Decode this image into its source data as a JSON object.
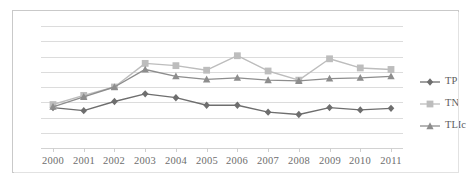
{
  "chart_data": {
    "type": "line",
    "title": "",
    "xlabel": "",
    "ylabel": "",
    "grid": true,
    "legend_position": "right",
    "categories": [
      "2000",
      "2001",
      "2002",
      "2003",
      "2004",
      "2005",
      "2006",
      "2007",
      "2008",
      "2009",
      "2010",
      "2011"
    ],
    "ylim": [
      0,
      8
    ],
    "yticks": [
      0,
      1,
      2,
      3,
      4,
      5,
      6,
      7,
      8
    ],
    "yticklabels_visible": false,
    "series": [
      {
        "name": "TP",
        "marker": "diamond",
        "color": "#6e6e6e",
        "values": [
          2.65,
          2.45,
          3.05,
          3.55,
          3.3,
          2.8,
          2.8,
          2.35,
          2.2,
          2.65,
          2.5,
          2.6
        ]
      },
      {
        "name": "TN",
        "marker": "square",
        "color": "#bdbdbd",
        "values": [
          2.85,
          3.45,
          4.0,
          5.55,
          5.4,
          5.1,
          6.05,
          5.05,
          4.45,
          5.85,
          5.25,
          5.15
        ]
      },
      {
        "name": "TLIc",
        "marker": "triangle",
        "color": "#8d8d8d",
        "values": [
          2.7,
          3.35,
          4.0,
          5.15,
          4.7,
          4.5,
          4.6,
          4.45,
          4.4,
          4.55,
          4.6,
          4.7
        ]
      }
    ]
  },
  "legend": {
    "entries": [
      {
        "label": "TP"
      },
      {
        "label": "TN"
      },
      {
        "label": "TLIc"
      }
    ]
  },
  "axis": {
    "x_tick_labels": [
      "2000",
      "2001",
      "2002",
      "2003",
      "2004",
      "2005",
      "2006",
      "2007",
      "2008",
      "2009",
      "2010",
      "2011"
    ]
  },
  "colors": {
    "tp": "#6e6e6e",
    "tn": "#bdbdbd",
    "tlic": "#8d8d8d",
    "gridline": "#dcdcdc",
    "frame": "#c9c9c9",
    "tick_text": "#6d6d6d"
  }
}
